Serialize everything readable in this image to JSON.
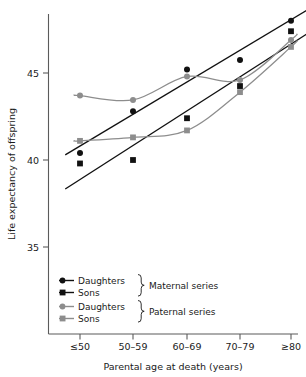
{
  "chart_data": {
    "type": "scatter",
    "title": "",
    "xlabel": "Parental age at death (years)",
    "ylabel": "Life expectancy of offspring",
    "categories": [
      "≤50",
      "50–59",
      "60–69",
      "70–79",
      "≥80"
    ],
    "x": [
      1,
      2,
      3,
      4,
      5
    ],
    "ylim": [
      33.0,
      49.0
    ],
    "yticks": [
      35,
      40,
      45
    ],
    "ytick_labels": [
      "35",
      "40",
      "45"
    ],
    "grid": false,
    "legend_position": "lower-left-inside",
    "series": [
      {
        "name": "Daughters",
        "group": "Maternal series",
        "marker": "circle",
        "color": "#111111",
        "values": [
          40.4,
          42.8,
          45.2,
          45.75,
          48.0
        ],
        "fit": "linear"
      },
      {
        "name": "Sons",
        "group": "Maternal series",
        "marker": "square",
        "color": "#111111",
        "values": [
          39.8,
          40.0,
          42.4,
          44.25,
          47.4
        ],
        "fit": "linear"
      },
      {
        "name": "Daughters",
        "group": "Paternal series",
        "marker": "circle",
        "color": "#8d8d8d",
        "values": [
          43.7,
          43.45,
          44.8,
          44.6,
          46.9
        ],
        "fit": "smooth"
      },
      {
        "name": "Sons",
        "group": "Paternal series",
        "marker": "square",
        "color": "#8d8d8d",
        "values": [
          41.1,
          41.3,
          41.7,
          43.9,
          46.5
        ],
        "fit": "smooth"
      }
    ],
    "legend": [
      {
        "label": "Daughters",
        "marker": "circle",
        "color": "#111111"
      },
      {
        "label": "Sons",
        "marker": "square",
        "color": "#111111"
      },
      {
        "label": "Daughters",
        "marker": "circle",
        "color": "#8d8d8d"
      },
      {
        "label": "Sons",
        "marker": "square",
        "color": "#8d8d8d"
      }
    ],
    "legend_groups": [
      {
        "label": "Maternal series"
      },
      {
        "label": "Paternal series"
      }
    ],
    "colors": {
      "maternal": "#111111",
      "paternal": "#8d8d8d",
      "axis": "#5b5b5b",
      "text": "#1a1a1a",
      "background": "#ffffff"
    }
  }
}
